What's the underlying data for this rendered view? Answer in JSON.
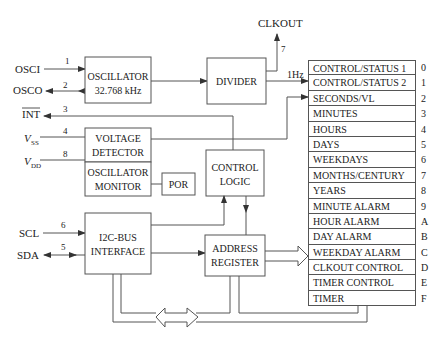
{
  "pins": {
    "osci": {
      "label": "OSCI",
      "num": "1"
    },
    "osco": {
      "label": "OSCO",
      "num": "2"
    },
    "int": {
      "label": "INT",
      "num": "3"
    },
    "vss": {
      "label": "V",
      "sub": "SS",
      "num": "4"
    },
    "vdd": {
      "label": "V",
      "sub": "DD",
      "num": "8"
    },
    "scl": {
      "label": "SCL",
      "num": "6"
    },
    "sda": {
      "label": "SDA",
      "num": "5"
    },
    "clkout": {
      "label": "CLKOUT",
      "num": "7"
    }
  },
  "blocks": {
    "oscillator": {
      "line1": "OSCILLATOR",
      "line2": "32.768 kHz"
    },
    "divider": {
      "line1": "DIVIDER"
    },
    "voltage_detector": {
      "line1": "VOLTAGE",
      "line2": "DETECTOR"
    },
    "oscillator_monitor": {
      "line1": "OSCILLATOR",
      "line2": "MONITOR"
    },
    "por": {
      "line1": "POR"
    },
    "control_logic": {
      "line1": "CONTROL",
      "line2": "LOGIC"
    },
    "i2c": {
      "line1": "I2C-BUS",
      "line2": "INTERFACE"
    },
    "address_register": {
      "line1": "ADDRESS",
      "line2": "REGISTER"
    }
  },
  "signals": {
    "one_hz": "1Hz"
  },
  "registers": [
    {
      "name": "CONTROL/STATUS 1",
      "addr": "0"
    },
    {
      "name": "CONTROL/STATUS 2",
      "addr": "1"
    },
    {
      "name": "SECONDS/VL",
      "addr": "2"
    },
    {
      "name": "MINUTES",
      "addr": "3"
    },
    {
      "name": "HOURS",
      "addr": "4"
    },
    {
      "name": "DAYS",
      "addr": "5"
    },
    {
      "name": "WEEKDAYS",
      "addr": "6"
    },
    {
      "name": "MONTHS/CENTURY",
      "addr": "7"
    },
    {
      "name": "YEARS",
      "addr": "8"
    },
    {
      "name": "MINUTE ALARM",
      "addr": "9"
    },
    {
      "name": "HOUR ALARM",
      "addr": "A"
    },
    {
      "name": "DAY ALARM",
      "addr": "B"
    },
    {
      "name": "WEEKDAY ALARM",
      "addr": "C"
    },
    {
      "name": "CLKOUT CONTROL",
      "addr": "D"
    },
    {
      "name": "TIMER CONTROL",
      "addr": "E"
    },
    {
      "name": "TIMER",
      "addr": "F"
    }
  ]
}
